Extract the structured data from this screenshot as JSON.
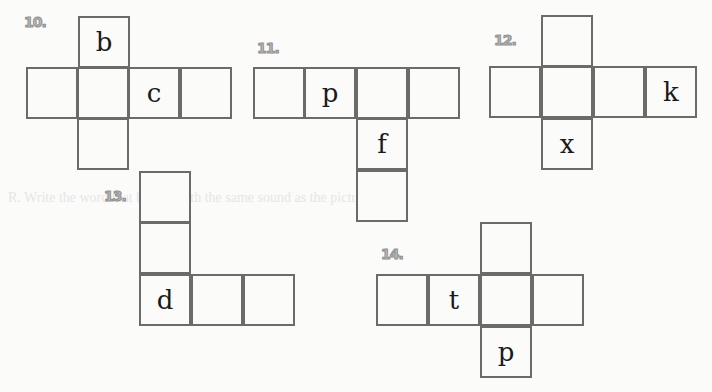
{
  "background_text": "R. Write the word that begins with the same sound as the picture.",
  "nets": [
    {
      "label": "10.",
      "letters": {
        "top": "b",
        "c": "c"
      }
    },
    {
      "label": "11.",
      "letters": {
        "p": "p",
        "f": "f"
      }
    },
    {
      "label": "12.",
      "letters": {
        "k": "k",
        "x": "x"
      }
    },
    {
      "label": "13.",
      "letters": {
        "d": "d"
      }
    },
    {
      "label": "14.",
      "letters": {
        "t": "t",
        "p": "p"
      }
    }
  ]
}
